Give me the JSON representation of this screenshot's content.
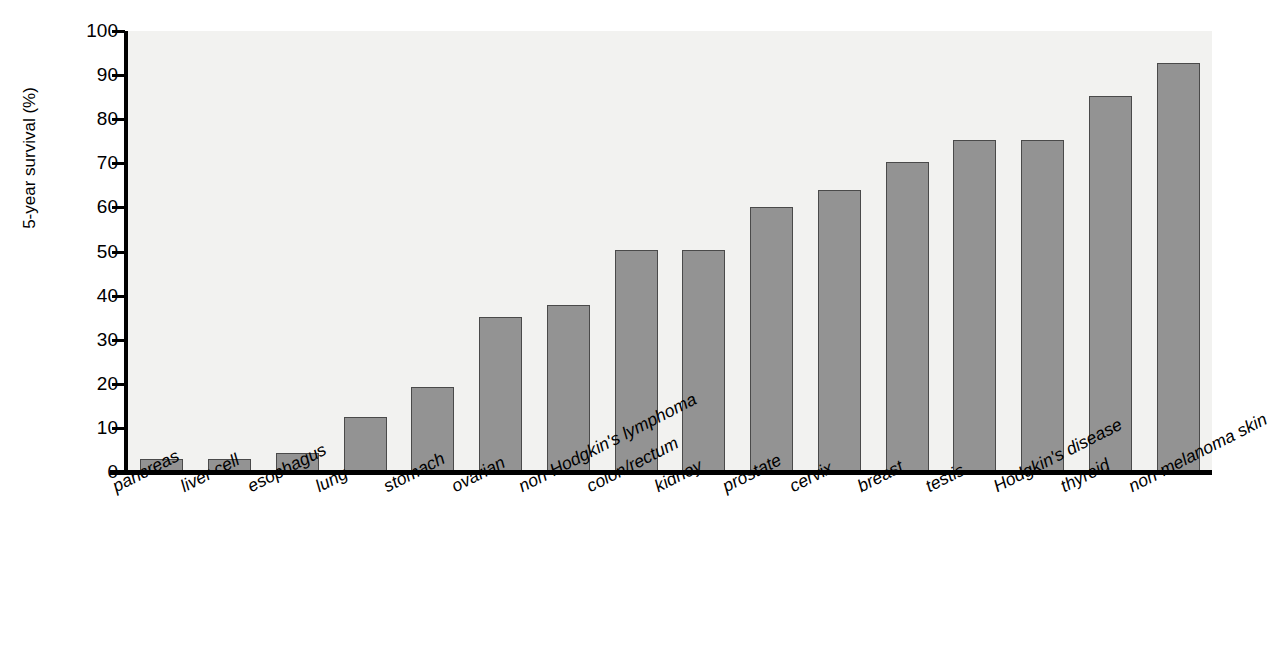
{
  "chart_data": {
    "type": "bar",
    "title": "",
    "xlabel": "",
    "ylabel": "5-year survival (%)",
    "ylim": [
      0,
      100
    ],
    "ytick_step": 10,
    "grid": false,
    "legend": false,
    "bar_fill_color": "#939393",
    "bar_border_color": "#4a4a4a",
    "plot_background_color": "#f2f2f0",
    "axis_color": "#000000",
    "yticks": [
      "100",
      "90",
      "80",
      "70",
      "60",
      "50",
      "40",
      "30",
      "20",
      "10",
      "0"
    ],
    "categories": [
      "pancreas",
      "liver cell",
      "esophagus",
      "lung",
      "stomach",
      "ovarian",
      "non-Hodgkin's lymphoma",
      "colon/rectum",
      "kidney",
      "prostate",
      "cervix",
      "breast",
      "testis",
      "Hodgkin's disease",
      "thyroid",
      "non-melanoma skin"
    ],
    "values": [
      3,
      2.9,
      4.2,
      12.5,
      19.3,
      35.2,
      37.8,
      50.3,
      50.3,
      60.2,
      63.9,
      70.3,
      75.2,
      75.4,
      85.3,
      92.8
    ]
  }
}
